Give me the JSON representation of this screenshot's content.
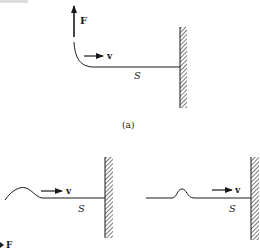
{
  "header": {
    "truncated_text": "..."
  },
  "panels": [
    {
      "id": "a",
      "caption": "(a)",
      "force_label": "F",
      "velocity_label": "v",
      "string_label": "S",
      "description": "String held at left by upward force F, fixed to wall at right, wave moving right"
    },
    {
      "id": "b-left",
      "force_label": "F",
      "velocity_label": "v",
      "string_label": "S",
      "description": "Wave pulse travelling right along string toward wall"
    },
    {
      "id": "b-right",
      "velocity_label": "v",
      "string_label": "S",
      "description": "Symmetric pulse travelling right toward wall"
    }
  ],
  "colors": {
    "line": "#1a1a1a",
    "hatch": "#555555",
    "background": "#ffffff"
  }
}
